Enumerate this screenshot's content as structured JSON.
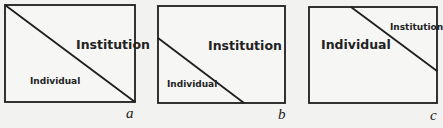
{
  "figure": {
    "type": "diagram",
    "colors": {
      "line": "#1e1e1e",
      "background": "#f2f2f0",
      "text": "#222222"
    },
    "panels": [
      {
        "id": "a",
        "letter": "a",
        "institution_label": "Institution",
        "individual_label": "Individual",
        "emphasis": "equal split; Institution label larger",
        "box": {
          "x": 5,
          "y": 5,
          "w": 130,
          "h": 97
        },
        "divider": {
          "x1": 5,
          "y1": 5,
          "x2": 135,
          "y2": 102
        }
      },
      {
        "id": "b",
        "letter": "b",
        "institution_label": "Institution",
        "individual_label": "Individual",
        "emphasis": "Institution region larger",
        "box": {
          "x": 158,
          "y": 6,
          "w": 127,
          "h": 97
        },
        "divider": {
          "x1": 158,
          "y1": 38,
          "x2": 244,
          "y2": 103
        }
      },
      {
        "id": "c",
        "letter": "c",
        "institution_label": "Institution",
        "individual_label": "Individual",
        "emphasis": "Individual region larger",
        "box": {
          "x": 309,
          "y": 7,
          "w": 128,
          "h": 96
        },
        "divider": {
          "x1": 351,
          "y1": 7,
          "x2": 437,
          "y2": 71
        }
      }
    ]
  }
}
